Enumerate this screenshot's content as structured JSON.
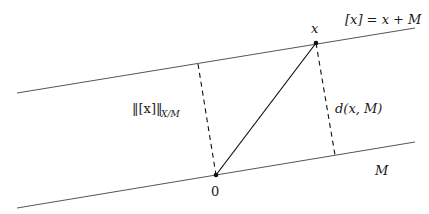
{
  "diagram": {
    "lines": {
      "coset": {
        "label": "[x] = x + M"
      },
      "subspace": {
        "label": "M"
      }
    },
    "points": {
      "origin": {
        "label": "0"
      },
      "x": {
        "label": "x"
      }
    },
    "segments": {
      "quotient_norm": {
        "label": "‖[x]‖",
        "subscript": "X/M",
        "style": "dashed"
      },
      "distance": {
        "label": "d(x, M)",
        "style": "dashed"
      },
      "vector": {
        "label": "",
        "style": "solid"
      }
    },
    "colors": {
      "line": "#555555",
      "ink": "#111111",
      "background": "#ffffff"
    }
  }
}
